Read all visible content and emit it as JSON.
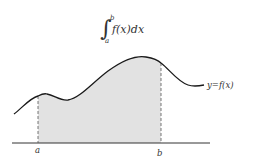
{
  "formula": {
    "integral_sign": "∫",
    "upper_limit": "b",
    "lower_limit": "a",
    "integrand": "f(x)dx"
  },
  "curve_label": "y=f(x)",
  "axis_labels": {
    "a": "a",
    "b": "b"
  },
  "colors": {
    "curve": "#1a1a1a",
    "shade": "#e2e2e2",
    "axis": "#333333",
    "dashed": "#555555"
  }
}
